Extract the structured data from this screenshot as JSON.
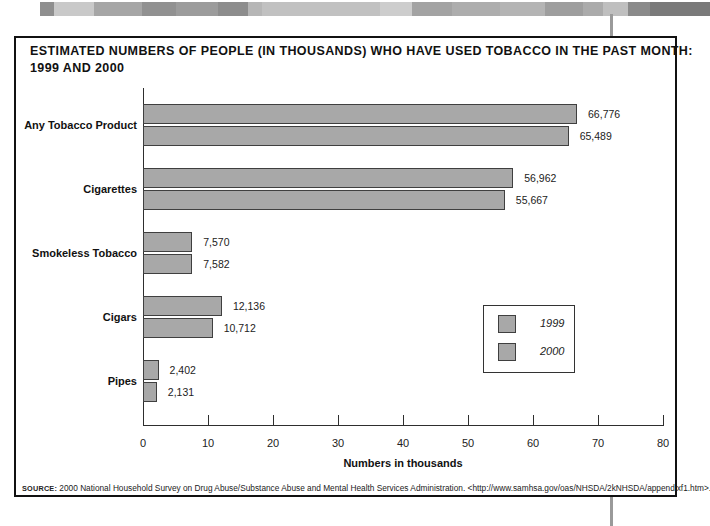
{
  "banner": {
    "segments": [
      {
        "x": 0,
        "w": 14,
        "color": "#8f8f8f"
      },
      {
        "x": 14,
        "w": 40,
        "color": "#c9c9c9"
      },
      {
        "x": 54,
        "w": 48,
        "color": "#a6a6a6"
      },
      {
        "x": 102,
        "w": 34,
        "color": "#919191"
      },
      {
        "x": 136,
        "w": 42,
        "color": "#9c9c9c"
      },
      {
        "x": 178,
        "w": 30,
        "color": "#8d8d8d"
      },
      {
        "x": 208,
        "w": 14,
        "color": "#b6b6b6"
      },
      {
        "x": 222,
        "w": 118,
        "color": "#c1c1c1"
      },
      {
        "x": 340,
        "w": 32,
        "color": "#cdcdcd"
      },
      {
        "x": 372,
        "w": 40,
        "color": "#a3a3a3"
      },
      {
        "x": 412,
        "w": 48,
        "color": "#adadad"
      },
      {
        "x": 460,
        "w": 45,
        "color": "#b4b4b4"
      },
      {
        "x": 505,
        "w": 38,
        "color": "#9e9e9e"
      },
      {
        "x": 543,
        "w": 20,
        "color": "#ababab"
      },
      {
        "x": 563,
        "w": 25,
        "color": "#bfbfbf"
      },
      {
        "x": 588,
        "w": 22,
        "color": "#8a8a8a"
      },
      {
        "x": 610,
        "w": 60,
        "color": "#7a7a7a"
      }
    ]
  },
  "decor": {
    "vertical_line_color": "#9a9a9a"
  },
  "chart_data": {
    "type": "bar",
    "orientation": "horizontal",
    "title": "ESTIMATED NUMBERS OF PEOPLE (IN THOUSANDS) WHO HAVE USED TOBACCO IN THE PAST MONTH: 1999 AND 2000",
    "title_line1": "ESTIMATED NUMBERS OF PEOPLE (IN THOUSANDS) WHO HAVE USED TOBACCO IN THE PAST MONTH:",
    "title_line2": "1999 AND 2000",
    "categories": [
      "Any Tobacco Product",
      "Cigarettes",
      "Smokeless Tobacco",
      "Cigars",
      "Pipes"
    ],
    "series": [
      {
        "name": "1999",
        "values": [
          66776,
          56962,
          7570,
          12136,
          2402
        ],
        "value_labels": [
          "66,776",
          "56,962",
          "7,570",
          "12,136",
          "2,402"
        ]
      },
      {
        "name": "2000",
        "values": [
          65489,
          55667,
          7582,
          10712,
          2131
        ],
        "value_labels": [
          "65,489",
          "55,667",
          "7,582",
          "10,712",
          "2,131"
        ]
      }
    ],
    "xlabel": "Numbers in thousands",
    "xlim": [
      0,
      80
    ],
    "xticks": [
      0,
      10,
      20,
      30,
      40,
      50,
      60,
      70,
      80
    ],
    "axis_unit_note": "axis shows values divided by 1,000",
    "grid": false,
    "legend_position": "middle-right",
    "bar_color": "#a8a8a8",
    "bar_border_color": "#3f3f3f"
  },
  "source": {
    "label": "SOURCE:",
    "text": " 2000 National Household Survey on Drug Abuse/Substance Abuse and Mental Health Services Administration. <http://www.samhsa.gov/oas/NHSDA/2kNHSDA/appendixf1.htm>."
  }
}
